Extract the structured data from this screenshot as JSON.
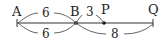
{
  "diagram": {
    "type": "number-line-segment",
    "points": [
      {
        "label": "A",
        "x": 17
      },
      {
        "label": "B",
        "x": 76
      },
      {
        "label": "P",
        "x": 104
      },
      {
        "label": "Q",
        "x": 153
      }
    ],
    "arcs": [
      {
        "from": "A",
        "to": "B",
        "position": "above",
        "value": "6"
      },
      {
        "from": "A",
        "to": "B",
        "position": "below",
        "value": "6"
      },
      {
        "from": "B",
        "to": "P",
        "position": "above",
        "value": "3"
      },
      {
        "from": "B",
        "to": "Q",
        "position": "below",
        "value": "8"
      }
    ]
  },
  "labels": {
    "A": "A",
    "B": "B",
    "P": "P",
    "Q": "Q",
    "ab_top": "6",
    "ab_bottom": "6",
    "bp_top": "3",
    "bq_bottom": "8"
  }
}
